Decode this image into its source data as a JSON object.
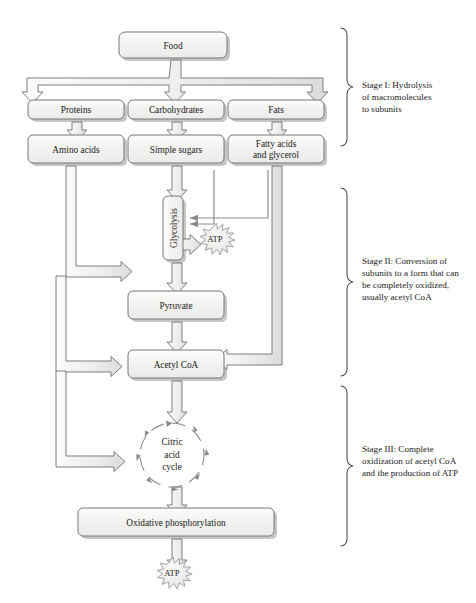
{
  "diagram": {
    "colors": {
      "box_fill": "#f2f2f0",
      "box_fill_top": "#fbfbfa",
      "box_stroke": "#7a7a78",
      "shadow": "#b9b9b7",
      "arrow_fill": "#e9e9e7",
      "arrow_stroke": "#6f6f6d",
      "thin_line": "#8a8a88",
      "text": "#1a1a1a",
      "background": "#ffffff"
    },
    "boxes": [
      {
        "id": "food",
        "label": "Food"
      },
      {
        "id": "proteins",
        "label": "Proteins"
      },
      {
        "id": "carbohydrates",
        "label": "Carbohydrates"
      },
      {
        "id": "fats",
        "label": "Fats"
      },
      {
        "id": "amino-acids",
        "label": "Amino acids"
      },
      {
        "id": "simple-sugars",
        "label": "Simple sugars"
      },
      {
        "id": "fatty-acids",
        "label": "Fatty acids",
        "label2": "and glycerol"
      },
      {
        "id": "glycolysis",
        "label": "Glycolysis",
        "orientation": "vertical"
      },
      {
        "id": "pyruvate",
        "label": "Pyruvate"
      },
      {
        "id": "acetyl-coa",
        "label": "Acetyl CoA"
      },
      {
        "id": "oxidative-phosphorylation",
        "label": "Oxidative phosphorylation"
      }
    ],
    "cycle": {
      "id": "citric-acid-cycle",
      "line1": "Citric",
      "line2": "acid",
      "line3": "cycle"
    },
    "atp_bursts": [
      {
        "id": "atp-glycolysis",
        "label": "ATP"
      },
      {
        "id": "atp-oxphos",
        "label": "ATP"
      }
    ],
    "stages": [
      {
        "id": "stage-1",
        "lines": [
          "Stage I: Hydrolysis",
          "of macromolecules",
          "to subunits"
        ]
      },
      {
        "id": "stage-2",
        "lines": [
          "Stage II: Conversion of",
          "subunits to a form that can",
          "be completely oxidized,",
          "usually acetyl CoA"
        ]
      },
      {
        "id": "stage-3",
        "lines": [
          "Stage III: Complete",
          "oxidization of acetyl CoA",
          "and the production of ATP"
        ]
      }
    ]
  }
}
